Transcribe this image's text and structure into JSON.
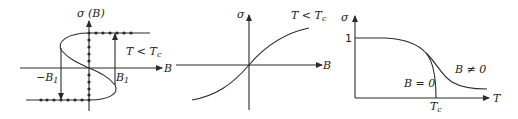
{
  "panels": [
    {
      "id": "hysteresis",
      "y_axis_label": "σ (B)",
      "x_axis_label": "B",
      "condition_label": "T < T",
      "condition_sub": "c",
      "neg_field_label": "−B",
      "neg_field_sub": "1",
      "pos_field_label": "B",
      "pos_field_sub": "1"
    },
    {
      "id": "response",
      "y_axis_label": "σ",
      "x_axis_label": "B",
      "condition_label": "T < T",
      "condition_sub": "c"
    },
    {
      "id": "temperature",
      "y_axis_label": "σ",
      "x_axis_label": "T",
      "y_tick_label": "1",
      "x_tick_label": "T",
      "x_tick_sub": "c",
      "curve_zero_label": "B = 0",
      "curve_nonzero_label": "B ≠ 0"
    }
  ],
  "colors": {
    "line": "#2a2a2a",
    "background": "#ffffff"
  }
}
